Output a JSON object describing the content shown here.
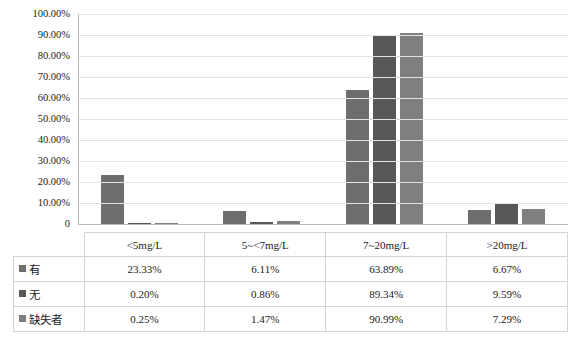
{
  "chart_data": {
    "type": "bar",
    "title": "",
    "xlabel": "",
    "ylabel": "",
    "grid": true,
    "legend_position": "table-left",
    "ylim": [
      0,
      100
    ],
    "ytick_labels": [
      "100.00%",
      "90.00%",
      "80.00%",
      "70.00%",
      "60.00%",
      "50.00%",
      "40.00%",
      "30.00%",
      "20.00%",
      "10.00%",
      "0"
    ],
    "ytick_values": [
      100,
      90,
      80,
      70,
      60,
      50,
      40,
      30,
      20,
      10,
      0
    ],
    "categories": [
      "<5mg/L",
      "5~<7mg/L",
      "7~20mg/L",
      ">20mg/L"
    ],
    "series": [
      {
        "name": "有",
        "color": "#6e6e6e",
        "values": [
          23.33,
          6.11,
          63.89,
          6.67
        ],
        "labels": [
          "23.33%",
          "6.11%",
          "63.89%",
          "6.67%"
        ]
      },
      {
        "name": "无",
        "color": "#585858",
        "values": [
          0.2,
          0.86,
          89.34,
          9.59
        ],
        "labels": [
          "0.20%",
          "0.86%",
          "89.34%",
          "9.59%"
        ]
      },
      {
        "name": "缺失者",
        "color": "#7f7f7f",
        "values": [
          0.25,
          1.47,
          90.99,
          7.29
        ],
        "labels": [
          "0.25%",
          "1.47%",
          "90.99%",
          "7.29%"
        ]
      }
    ]
  },
  "table": {
    "corner_label": "",
    "column_headers": [
      "<5mg/L",
      "5~<7mg/L",
      "7~20mg/L",
      ">20mg/L"
    ],
    "rows": [
      {
        "label": "有",
        "color": "#6e6e6e",
        "values": [
          "23.33%",
          "6.11%",
          "63.89%",
          "6.67%"
        ]
      },
      {
        "label": "无",
        "color": "#585858",
        "values": [
          "0.20%",
          "0.86%",
          "89.34%",
          "9.59%"
        ]
      },
      {
        "label": "缺失者",
        "color": "#7f7f7f",
        "values": [
          "0.25%",
          "1.47%",
          "90.99%",
          "7.29%"
        ]
      }
    ]
  }
}
